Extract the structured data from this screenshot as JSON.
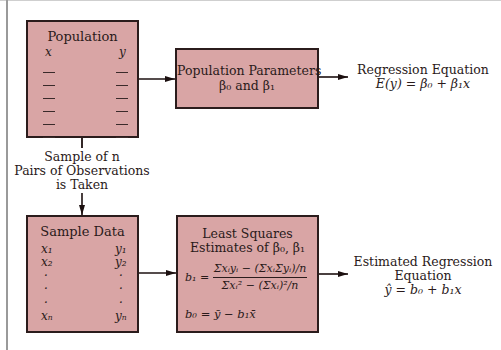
{
  "population_box": {
    "title": "Population",
    "x_header": "x",
    "y_header": "y",
    "row_count": 6
  },
  "population_parameters_box": {
    "title": "Population Parameters",
    "subtitle": "β₀ and β₁"
  },
  "regression_equation": {
    "title": "Regression Equation",
    "formula": "E(y) = β₀ + β₁x"
  },
  "sampling_step": {
    "line1": "Sample of n",
    "line2": "Pairs of Observations",
    "line3": "is Taken"
  },
  "sample_data_box": {
    "title": "Sample Data",
    "x_values": [
      "x₁",
      "x₂",
      "·",
      "·",
      "·",
      "xₙ"
    ],
    "y_values": [
      "y₁",
      "y₂",
      "·",
      "·",
      "·",
      "yₙ"
    ]
  },
  "least_squares_box": {
    "title_line1": "Least Squares",
    "title_line2": "Estimates of β₀, β₁",
    "b1_lhs": "b₁ =",
    "b1_numerator": "Σxᵢyᵢ − (ΣxᵢΣyᵢ)/n",
    "b1_denominator": "Σxᵢ² − (Σxᵢ)²/n",
    "b0_formula": "b₀ = ȳ − b₁x̄"
  },
  "estimated_regression_equation": {
    "line1": "Estimated Regression",
    "line2": "Equation",
    "formula": "ŷ = b₀ + b₁x"
  },
  "colors": {
    "box_fill": "#d9a5a5",
    "box_border": "#2b1c1c",
    "background": "#ffffff"
  }
}
